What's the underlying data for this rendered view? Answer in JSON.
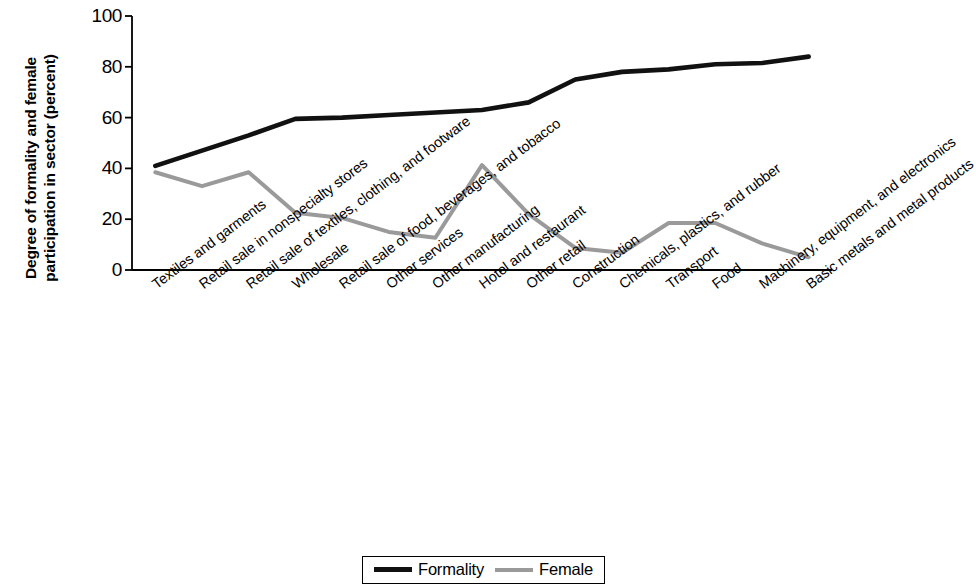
{
  "chart_data": {
    "type": "line",
    "title": "",
    "xlabel": "",
    "ylabel": "Degree of formality and female participation in sector (percent)",
    "ylim": [
      0,
      100
    ],
    "yticks": [
      0,
      20,
      40,
      60,
      80,
      100
    ],
    "grid": false,
    "legend_position": "bottom-center",
    "categories": [
      "Textiles and garments",
      "Retail sale in nonspecialty stores",
      "Retail sale of textiles, clothing, and footware",
      "Wholesale",
      "Retail sale of food, beverages, and tobacco",
      "Other services",
      "Other manufacturing",
      "Hotel and restaurant",
      "Other retail",
      "Construction",
      "Chemicals, plastics, and rubber",
      "Transport",
      "Food",
      "Machinery, equipment, and electronics",
      "Basic metals and metal products"
    ],
    "series": [
      {
        "name": "Formality",
        "color": "#111111",
        "values": [
          41,
          47,
          53,
          59.5,
          60,
          61,
          62,
          63,
          66,
          75,
          78,
          79,
          81,
          81.5,
          84
        ]
      },
      {
        "name": "Female",
        "color": "#9a9a9a",
        "values": [
          38.5,
          33,
          38.5,
          22.5,
          20.5,
          15,
          12.7,
          41.3,
          22,
          8.7,
          6.8,
          18.5,
          18.5,
          10.5,
          5
        ]
      }
    ]
  },
  "legend": {
    "items": [
      {
        "label": "Formality",
        "swatch": "black"
      },
      {
        "label": "Female",
        "swatch": "gray"
      }
    ]
  }
}
